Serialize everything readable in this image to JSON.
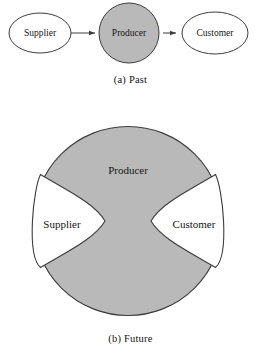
{
  "figure": {
    "panels": [
      {
        "id": "past",
        "caption": "(a) Past",
        "type": "linear-chain",
        "nodes": [
          {
            "id": "supplier",
            "label": "Supplier",
            "shape": "ellipse",
            "fill": "#ffffff"
          },
          {
            "id": "producer",
            "label": "Producer",
            "shape": "circle",
            "fill": "#b9b9b9"
          },
          {
            "id": "customer",
            "label": "Customer",
            "shape": "ellipse",
            "fill": "#ffffff"
          }
        ],
        "connectors": [
          {
            "from": "supplier",
            "to": "producer",
            "style": "arrow"
          },
          {
            "from": "producer",
            "to": "customer",
            "style": "arrow"
          }
        ]
      },
      {
        "id": "future",
        "caption": "(b) Future",
        "type": "integrated-circle",
        "outer": {
          "id": "producer",
          "label": "Producer",
          "shape": "circle",
          "fill": "#b9b9b9"
        },
        "inset_regions": [
          {
            "id": "supplier",
            "label": "Supplier",
            "side": "left",
            "fill": "#ffffff"
          },
          {
            "id": "customer",
            "label": "Customer",
            "side": "right",
            "fill": "#ffffff"
          }
        ]
      }
    ]
  },
  "colors": {
    "background": "#ffffff",
    "shape_fill_gray": "#b9b9b9",
    "shape_fill_white": "#ffffff",
    "stroke": "#3c3c3c",
    "text": "#151515"
  }
}
